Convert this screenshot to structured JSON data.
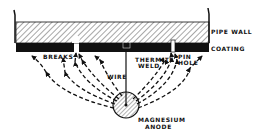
{
  "diagram": {
    "labels": {
      "pipe_wall": "PIPE WALL",
      "coating": "COATING",
      "breaks": "BREAKS",
      "thermite_weld_1": "THERMITE",
      "thermite_weld_2": "WELD",
      "pin_hole_1": "PIN",
      "pin_hole_2": "HOLE",
      "wire": "WIRE",
      "anode_1": "MAGNESIUM",
      "anode_2": "ANODE"
    },
    "colors": {
      "ink": "#111111",
      "background": "#ffffff"
    }
  }
}
